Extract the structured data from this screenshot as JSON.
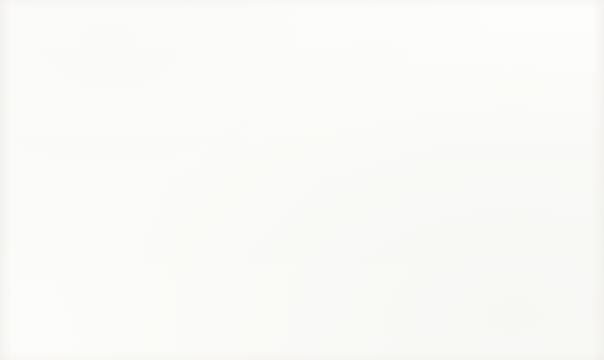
{
  "slide": {
    "title": "How easy is it for you to take medical leave for a mental health condition?",
    "source_note": "Source: OSMI Mental Health in Tech Survey"
  },
  "legend": {
    "position": "right",
    "items": [
      {
        "label": "Don't know",
        "color": "#1F5380"
      },
      {
        "label": "Somewhat easy",
        "color": "#1F6FA0"
      },
      {
        "label": "Very easy",
        "color": "#BEBEBE"
      },
      {
        "label": "Somewhat difficult",
        "color": "#9B9B9B"
      },
      {
        "label": "Very difficult",
        "color": "#F5A85A"
      }
    ]
  },
  "chart_data": {
    "type": "pie",
    "variant": "donut",
    "title": "How easy is it for you to take medical leave for a mental health condition?",
    "categories": [
      "Don't know",
      "Somewhat easy",
      "Very easy",
      "Somewhat difficult",
      "Very difficult"
    ],
    "values": [
      563,
      266,
      206,
      126,
      98
    ],
    "colors": [
      "#1F5380",
      "#1F6FA0",
      "#BEBEBE",
      "#9B9B9B",
      "#F5A85A"
    ],
    "data_labels": [
      "563",
      "266",
      "206",
      "126",
      "98"
    ],
    "total": 1259,
    "percentages": [
      44.7,
      21.1,
      16.4,
      10.0,
      7.8
    ],
    "start_angle_deg": 0,
    "direction": "clockwise",
    "inner_radius_ratio": 0.54,
    "label_color": "#ffffff",
    "slice_gap": true,
    "legend_position": "right",
    "grid": false,
    "source": "OSMI Mental Health in Tech Survey"
  }
}
